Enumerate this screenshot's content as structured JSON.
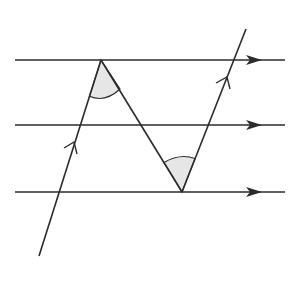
{
  "diagram": {
    "title": "",
    "colors": {
      "line": "#2b2b2b",
      "angle_fill": "#e6e6e6",
      "background": "#ffffff"
    },
    "parallel_lines": [
      {
        "name": "top",
        "x1": 15,
        "y1": 60,
        "x2": 285,
        "y2": 60,
        "arrow_x": 252
      },
      {
        "name": "middle",
        "x1": 15,
        "y1": 125,
        "x2": 285,
        "y2": 125,
        "arrow_x": 252
      },
      {
        "name": "bottom",
        "x1": 15,
        "y1": 192,
        "x2": 285,
        "y2": 192,
        "arrow_x": 252
      }
    ],
    "transversals": [
      {
        "name": "left",
        "x1": 39,
        "y1": 256,
        "x2": 101,
        "y2": 60,
        "chevron_at": [
          74,
          144
        ]
      },
      {
        "name": "diagonal",
        "x1": 101,
        "y1": 60,
        "x2": 182,
        "y2": 192
      },
      {
        "name": "right",
        "x1": 182,
        "y1": 192,
        "x2": 246,
        "y2": 29,
        "chevron_at": [
          228,
          77
        ]
      }
    ],
    "shaded_angles": [
      {
        "name": "top-angle",
        "vertex": [
          101,
          60
        ]
      },
      {
        "name": "bottom-angle",
        "vertex": [
          182,
          192
        ]
      }
    ]
  }
}
